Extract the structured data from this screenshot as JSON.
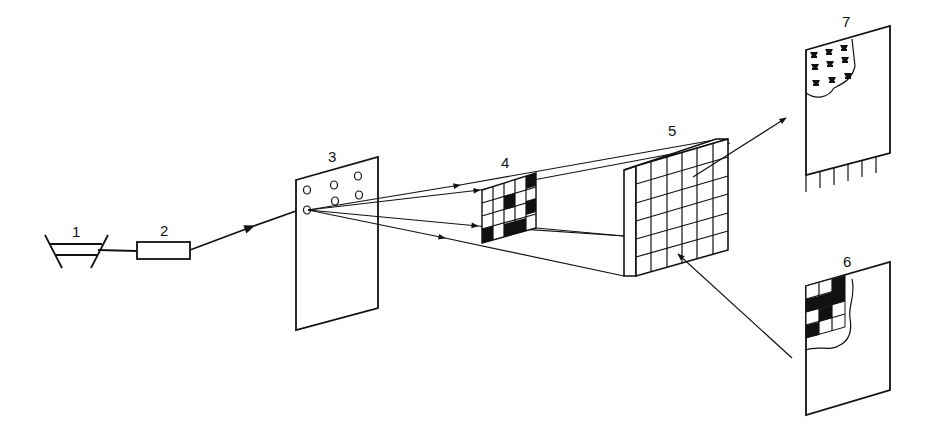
{
  "diagram": {
    "labels": {
      "item1": "1",
      "item2": "2",
      "item3": "3",
      "item4": "4",
      "item5": "5",
      "item6": "6",
      "item7": "7"
    },
    "colors": {
      "ink": "#111111",
      "background": "#ffffff"
    },
    "components": [
      {
        "id": "1",
        "shape": "trapezoid-source"
      },
      {
        "id": "2",
        "shape": "rectangle-box"
      },
      {
        "id": "3",
        "shape": "panel-with-holes",
        "holes": 6
      },
      {
        "id": "4",
        "shape": "checker-grid-mask"
      },
      {
        "id": "5",
        "shape": "grid-screen-6x6"
      },
      {
        "id": "6",
        "shape": "sheet-with-checker-pattern"
      },
      {
        "id": "7",
        "shape": "sheet-with-bell-pattern-and-comb"
      }
    ]
  }
}
